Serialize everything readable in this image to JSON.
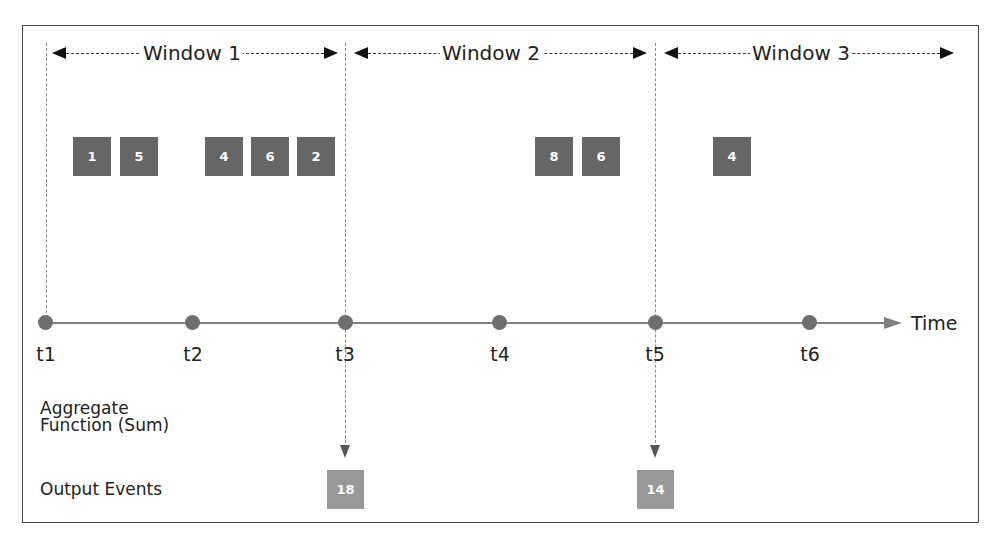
{
  "diagram": {
    "type": "tumbling-window-timeline",
    "windows": [
      {
        "label": "Window 1",
        "start": "t1",
        "end": "t3"
      },
      {
        "label": "Window 2",
        "start": "t3",
        "end": "t5"
      },
      {
        "label": "Window 3",
        "start": "t5",
        "end": "beyond t6"
      }
    ],
    "input_events": [
      {
        "window": "Window 1",
        "values": [
          "1",
          "5",
          "4",
          "6",
          "2"
        ]
      },
      {
        "window": "Window 2",
        "values": [
          "8",
          "6"
        ]
      },
      {
        "window": "Window 3",
        "values": [
          "4"
        ]
      }
    ],
    "timeline": {
      "ticks": [
        "t1",
        "t2",
        "t3",
        "t4",
        "t5",
        "t6"
      ],
      "axis_label": "Time"
    },
    "rows": {
      "aggregate_label_line1": "Aggregate",
      "aggregate_label_line2": "Function (Sum)",
      "output_label": "Output Events"
    },
    "outputs": [
      {
        "at": "t3",
        "value": "18"
      },
      {
        "at": "t5",
        "value": "14"
      }
    ],
    "colors": {
      "event_box": "#666666",
      "output_box": "#999999",
      "timeline": "#808080",
      "dot": "#6e6e6e",
      "frame": "#444444"
    }
  }
}
